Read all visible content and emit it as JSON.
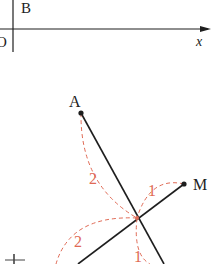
{
  "top_figure": {
    "labels": {
      "B": "B",
      "O": "O",
      "x": "x"
    }
  },
  "bottom_figure": {
    "points": {
      "A": "A",
      "M": "M"
    },
    "arc_labels": [
      "2",
      "1",
      "2",
      "1"
    ],
    "partial_label": "↕"
  },
  "colors": {
    "line": "#1e1e1e",
    "dashed": "#e06a55"
  }
}
